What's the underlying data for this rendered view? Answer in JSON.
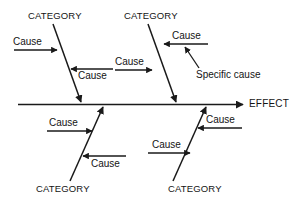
{
  "diagram": {
    "type": "fishbone-ishikawa",
    "stroke_color": "#1a1a1a",
    "text_color": "#141414",
    "background_color": "#ffffff",
    "effect_label": "EFFECT",
    "specific_cause_label": "Specific cause",
    "categories": [
      {
        "id": "top-left",
        "label": "CATEGORY"
      },
      {
        "id": "top-right",
        "label": "CATEGORY"
      },
      {
        "id": "bottom-left",
        "label": "CATEGORY"
      },
      {
        "id": "bottom-right",
        "label": "CATEGORY"
      }
    ],
    "causes": [
      {
        "id": "tl-upper",
        "label": "Cause",
        "direction": "right"
      },
      {
        "id": "tl-lower",
        "label": "Cause",
        "direction": "left"
      },
      {
        "id": "tr-upper",
        "label": "Cause",
        "direction": "left"
      },
      {
        "id": "tr-lower",
        "label": "Cause",
        "direction": "right"
      },
      {
        "id": "bl-upper",
        "label": "Cause",
        "direction": "right"
      },
      {
        "id": "bl-lower",
        "label": "Cause",
        "direction": "left"
      },
      {
        "id": "br-upper",
        "label": "Cause",
        "direction": "left"
      },
      {
        "id": "br-lower",
        "label": "Cause",
        "direction": "right"
      }
    ]
  }
}
